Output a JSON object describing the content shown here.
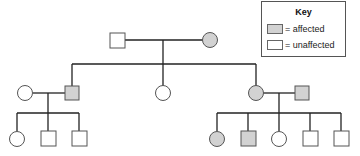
{
  "key": {
    "title": "Key",
    "items": [
      {
        "label": "= affected",
        "status": "affected",
        "color": "#d2d2d2"
      },
      {
        "label": "= unaffected",
        "status": "unaffected",
        "color": "#ffffff"
      }
    ]
  },
  "colors": {
    "affected": "#d2d2d2",
    "unaffected": "#ffffff",
    "line": "#222222",
    "outline": "#555555"
  },
  "pedigree": {
    "generation_1": [
      {
        "id": "I-1",
        "sex": "male",
        "status": "unaffected"
      },
      {
        "id": "I-2",
        "sex": "female",
        "status": "affected"
      }
    ],
    "generation_2": [
      {
        "id": "II-1",
        "sex": "female",
        "status": "unaffected",
        "note": "married-in spouse of II-2"
      },
      {
        "id": "II-2",
        "sex": "male",
        "status": "affected"
      },
      {
        "id": "II-3",
        "sex": "female",
        "status": "unaffected"
      },
      {
        "id": "II-4",
        "sex": "female",
        "status": "affected"
      },
      {
        "id": "II-5",
        "sex": "male",
        "status": "affected",
        "note": "married-in spouse of II-4"
      }
    ],
    "generation_3": [
      {
        "id": "III-1",
        "sex": "female",
        "status": "unaffected",
        "parents": [
          "II-1",
          "II-2"
        ]
      },
      {
        "id": "III-2",
        "sex": "male",
        "status": "unaffected",
        "parents": [
          "II-1",
          "II-2"
        ]
      },
      {
        "id": "III-3",
        "sex": "male",
        "status": "unaffected",
        "parents": [
          "II-1",
          "II-2"
        ]
      },
      {
        "id": "III-4",
        "sex": "female",
        "status": "affected",
        "parents": [
          "II-4",
          "II-5"
        ]
      },
      {
        "id": "III-5",
        "sex": "male",
        "status": "affected",
        "parents": [
          "II-4",
          "II-5"
        ]
      },
      {
        "id": "III-6",
        "sex": "female",
        "status": "unaffected",
        "parents": [
          "II-4",
          "II-5"
        ]
      },
      {
        "id": "III-7",
        "sex": "male",
        "status": "unaffected",
        "parents": [
          "II-4",
          "II-5"
        ]
      },
      {
        "id": "III-8",
        "sex": "male",
        "status": "unaffected",
        "parents": [
          "II-4",
          "II-5"
        ]
      }
    ]
  }
}
